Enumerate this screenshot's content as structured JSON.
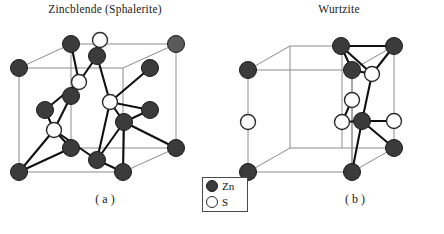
{
  "figure": {
    "titles": {
      "a": "Zincblende (Sphalerite)",
      "b": "Wurtzite"
    },
    "panel_labels": {
      "a": "( a )",
      "b": "( b )"
    },
    "caption": "",
    "legend": {
      "items": [
        {
          "symbol": "Zn",
          "icon": "filled-circle-icon",
          "color": "#3b3b3b"
        },
        {
          "symbol": "S",
          "icon": "open-circle-icon",
          "color": "#ffffff"
        }
      ]
    },
    "colors": {
      "zn_fill": "#3b3b3b",
      "zn_stroke": "#1a1a1a",
      "s_fill": "#ffffff",
      "s_stroke": "#2b2b2b",
      "cell_edge": "#8c8c8c",
      "bond": "#111111",
      "background": "#ffffff"
    },
    "structures": {
      "zincblende": {
        "name": "Zincblende (Sphalerite)",
        "cell_type": "cubic",
        "cell_vertices": {
          "front_top_left": [
            19,
            68
          ],
          "front_top_right": [
            123,
            68
          ],
          "front_bot_left": [
            19,
            172
          ],
          "front_bot_right": [
            123,
            172
          ],
          "back_top_left": [
            71,
            44
          ],
          "back_top_right": [
            176,
            44
          ],
          "back_bot_left": [
            71,
            148
          ],
          "back_bot_right": [
            176,
            148
          ]
        },
        "zn_atoms": [
          [
            19,
            68
          ],
          [
            123,
            68
          ],
          [
            19,
            172
          ],
          [
            123,
            172
          ],
          [
            71,
            44
          ],
          [
            176,
            44
          ],
          [
            176,
            148
          ],
          [
            97,
            56
          ],
          [
            45,
            110
          ],
          [
            150,
            110
          ],
          [
            97,
            160
          ],
          [
            71,
            96
          ],
          [
            124,
            122
          ],
          [
            150,
            68
          ]
        ],
        "s_atoms": [
          [
            79,
            82
          ],
          [
            110,
            102
          ],
          [
            54,
            130
          ],
          [
            102,
            71
          ]
        ],
        "radius_zn": 8.5,
        "radius_s": 7.5
      },
      "wurtzite": {
        "name": "Wurtzite",
        "cell_type": "hexagonal-prism-box",
        "cell_vertices": {
          "front_top_left": [
            248,
            70
          ],
          "front_top_right": [
            352,
            70
          ],
          "front_bot_left": [
            248,
            172
          ],
          "front_bot_right": [
            352,
            172
          ],
          "back_top_left": [
            290,
            46
          ],
          "back_top_right": [
            394,
            46
          ],
          "back_bot_left": [
            290,
            148
          ],
          "back_bot_right": [
            394,
            148
          ]
        },
        "zn_atoms": [
          [
            248,
            70
          ],
          [
            290,
            46
          ],
          [
            394,
            46
          ],
          [
            248,
            172
          ],
          [
            352,
            172
          ],
          [
            394,
            148
          ],
          [
            341,
            70
          ],
          [
            362,
            121
          ]
        ],
        "s_atoms": [
          [
            248,
            122
          ],
          [
            372,
            74
          ],
          [
            342,
            122
          ],
          [
            337,
            116
          ],
          [
            394,
            121
          ]
        ],
        "radius_zn": 8.5,
        "radius_s": 7.5
      }
    }
  }
}
